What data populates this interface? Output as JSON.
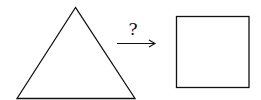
{
  "diagram": {
    "source_shape": "triangle",
    "target_shape": "square",
    "transform_label": "?",
    "stroke_color": "#111111",
    "background": "#ffffff"
  }
}
